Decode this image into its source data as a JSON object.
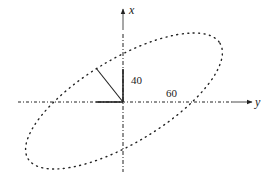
{
  "diagram": {
    "axes": {
      "vertical": {
        "label": "x"
      },
      "horizontal": {
        "label": "y"
      }
    },
    "dimensions": {
      "vertical_segment": "40",
      "horizontal_annotation": "60"
    },
    "colors": {
      "ink": "#222222",
      "background": "#ffffff"
    }
  }
}
